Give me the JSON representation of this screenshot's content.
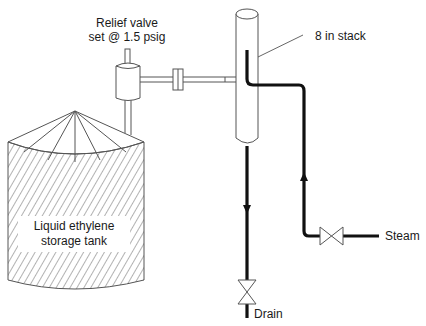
{
  "diagram": {
    "type": "process-flow-schematic",
    "labels": {
      "relief_valve_line1": "Relief valve",
      "relief_valve_line2": "set @ 1.5 psig",
      "stack": "8 in stack",
      "tank_line1": "Liquid ethylene",
      "tank_line2": "storage tank",
      "steam": "Steam",
      "drain": "Drain"
    },
    "components": [
      {
        "id": "storage-tank",
        "label": "Liquid ethylene storage tank",
        "style": "hatched cylinder with conical roof"
      },
      {
        "id": "relief-valve",
        "label": "Relief valve set @ 1.5 psig"
      },
      {
        "id": "flange",
        "label": ""
      },
      {
        "id": "vent-stack",
        "label": "8 in stack"
      },
      {
        "id": "steam-valve",
        "label": "Steam inlet valve"
      },
      {
        "id": "drain-valve",
        "label": "Drain valve"
      }
    ],
    "connections": [
      {
        "from": "storage-tank",
        "to": "relief-valve"
      },
      {
        "from": "relief-valve",
        "to": "vent-stack",
        "via": "flange"
      },
      {
        "from": "steam-valve",
        "to": "vent-stack",
        "flow": "up"
      },
      {
        "from": "vent-stack",
        "to": "drain-valve",
        "flow": "down"
      }
    ],
    "colors": {
      "line": "#555555",
      "pipe": "#111111",
      "background": "#ffffff"
    }
  }
}
